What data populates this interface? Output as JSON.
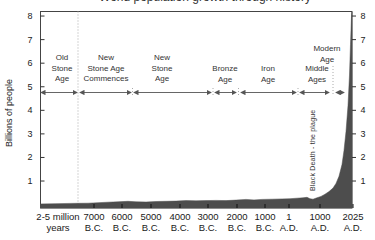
{
  "title_clipped": "World population growth through history",
  "y_axis": {
    "label": "Billions of people",
    "ticks": [
      8,
      7,
      6,
      5,
      4,
      3,
      2,
      1
    ]
  },
  "x_axis": {
    "ticks": [
      {
        "line1": "2-5 million",
        "line2": "years"
      },
      {
        "line1": "7000",
        "line2": "B.C."
      },
      {
        "line1": "6000",
        "line2": "B.C."
      },
      {
        "line1": "5000",
        "line2": "B.C."
      },
      {
        "line1": "4000",
        "line2": "B.C."
      },
      {
        "line1": "3000",
        "line2": "B.C."
      },
      {
        "line1": "2000",
        "line2": "B.C."
      },
      {
        "line1": "1000",
        "line2": "B.C."
      },
      {
        "line1": "1",
        "line2": "A.D."
      },
      {
        "line1": "1000",
        "line2": "A.D."
      },
      {
        "line1": "2025",
        "line2": "A.D."
      }
    ]
  },
  "eras": [
    {
      "name": "old-stone-age",
      "lines": [
        "Old",
        "Stone",
        "Age"
      ]
    },
    {
      "name": "new-stone-age-commences",
      "lines": [
        "New",
        "Stone Age",
        "Commences"
      ]
    },
    {
      "name": "new-stone-age",
      "lines": [
        "New",
        "Stone",
        "Age"
      ]
    },
    {
      "name": "bronze-age",
      "lines": [
        "Bronze",
        "Age"
      ]
    },
    {
      "name": "iron-age",
      "lines": [
        "Iron",
        "Age"
      ]
    },
    {
      "name": "middle-ages",
      "lines": [
        "Middle",
        "Ages"
      ]
    },
    {
      "name": "modern-age",
      "lines": [
        "Modern",
        "Age"
      ]
    }
  ],
  "annotations": {
    "black_death": "Black Death - the plague"
  },
  "colors": {
    "fill": "#4d4d4d",
    "frame": "#444444",
    "dotted": "#aaaaaa",
    "text": "#222222",
    "arrow": "#555555",
    "tick": "#333333"
  },
  "chart_data": {
    "type": "area",
    "ylabel": "Billions of people",
    "ylim": [
      0,
      8
    ],
    "grid": false,
    "categories": [
      "2-5 million years",
      "7000 B.C.",
      "6000 B.C.",
      "5000 B.C.",
      "4000 B.C.",
      "3000 B.C.",
      "2000 B.C.",
      "1000 B.C.",
      "1 A.D.",
      "1000 A.D.",
      "2025 A.D."
    ],
    "values": [
      0.01,
      0.05,
      0.08,
      0.1,
      0.14,
      0.17,
      0.18,
      0.22,
      0.25,
      0.31,
      8.2
    ],
    "annotations": [
      {
        "label": "Black Death - the plague",
        "near": "1000-1400 A.D.",
        "effect": "dip to ~0.23 billion"
      }
    ],
    "era_spans": [
      {
        "label": "Old Stone Age",
        "from": "2-5 million years ago",
        "to": "7000 B.C."
      },
      {
        "label": "New Stone Age Commences",
        "from": "7000 B.C.",
        "to": "5500 B.C."
      },
      {
        "label": "New Stone Age",
        "from": "5500 B.C.",
        "to": "3000 B.C."
      },
      {
        "label": "Bronze Age",
        "from": "3000 B.C.",
        "to": "2200 B.C."
      },
      {
        "label": "Iron Age",
        "from": "2200 B.C.",
        "to": "400 A.D."
      },
      {
        "label": "Middle Ages",
        "from": "400 A.D.",
        "to": "1400 A.D."
      },
      {
        "label": "Modern Age",
        "from": "1400 A.D.",
        "to": "2025 A.D."
      }
    ]
  },
  "layout": {
    "plot": {
      "left": 40.5,
      "top": 11.5,
      "right": 352,
      "bottom": 208
    },
    "y0": 204.6,
    "y_unit": 23.57,
    "y_label_left_x": 30,
    "y_label_right_x": 363,
    "x_tick_centers": [
      58,
      94,
      122,
      151,
      180,
      208,
      237,
      265,
      289,
      320,
      353
    ],
    "x_label_top": 211,
    "arrow_y": 92.5,
    "era_geom": [
      {
        "cx": 62,
        "top": 53,
        "x0": 41,
        "x1": 77
      },
      {
        "cx": 106,
        "top": 53,
        "x0": 80,
        "x1": 131
      },
      {
        "cx": 162,
        "top": 53,
        "x0": 134,
        "x1": 211
      },
      {
        "cx": 225,
        "top": 64,
        "x0": 215,
        "x1": 236
      },
      {
        "cx": 268,
        "top": 64,
        "x0": 241,
        "x1": 296
      },
      {
        "cx": 317,
        "top": 64,
        "x0": 300,
        "x1": 329
      },
      {
        "cx": 327,
        "top": 44,
        "x0": 336,
        "x1": 344
      }
    ],
    "separators": [
      {
        "x": 132.5,
        "y1": 88,
        "y2": 97
      },
      {
        "x": 213,
        "y1": 88,
        "y2": 97
      },
      {
        "x": 238.5,
        "y1": 88,
        "y2": 97
      },
      {
        "x": 298,
        "y1": 88,
        "y2": 97
      },
      {
        "x": 333,
        "y1": 66,
        "y2": 96
      }
    ],
    "dotted_line": {
      "x": 78,
      "y1": 11.5,
      "y2": 208
    },
    "curve_px": [
      [
        40.5,
        0.03
      ],
      [
        55,
        0.04
      ],
      [
        70,
        0.05
      ],
      [
        78,
        0.055
      ],
      [
        88,
        0.06
      ],
      [
        98,
        0.08
      ],
      [
        108,
        0.1
      ],
      [
        118,
        0.12
      ],
      [
        128,
        0.14
      ],
      [
        136,
        0.12
      ],
      [
        146,
        0.11
      ],
      [
        156,
        0.13
      ],
      [
        166,
        0.14
      ],
      [
        176,
        0.15
      ],
      [
        186,
        0.17
      ],
      [
        196,
        0.16
      ],
      [
        206,
        0.17
      ],
      [
        216,
        0.18
      ],
      [
        226,
        0.17
      ],
      [
        236,
        0.19
      ],
      [
        246,
        0.22
      ],
      [
        254,
        0.2
      ],
      [
        262,
        0.22
      ],
      [
        272,
        0.23
      ],
      [
        282,
        0.24
      ],
      [
        290,
        0.25
      ],
      [
        297,
        0.27
      ],
      [
        303,
        0.29
      ],
      [
        307,
        0.31
      ],
      [
        310,
        0.25
      ],
      [
        313,
        0.23
      ],
      [
        317,
        0.29
      ],
      [
        321,
        0.35
      ],
      [
        325,
        0.44
      ],
      [
        329,
        0.55
      ],
      [
        333,
        0.7
      ],
      [
        336,
        0.9
      ],
      [
        339,
        1.2
      ],
      [
        342,
        1.7
      ],
      [
        344,
        2.3
      ],
      [
        346,
        3.1
      ],
      [
        348,
        4.2
      ],
      [
        349.5,
        5.5
      ],
      [
        350.5,
        6.8
      ],
      [
        351.5,
        8.0
      ],
      [
        352,
        8.2
      ]
    ],
    "black_death_pos": {
      "left": 309,
      "top": 191
    },
    "y_axis_title_pos": {
      "left": 4,
      "top": 159
    }
  }
}
